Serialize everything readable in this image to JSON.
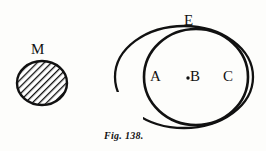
{
  "figure": {
    "caption": "Fig. 138.",
    "background_color": "#fdfdfb",
    "ink_color": "#111111",
    "labels": {
      "m": "M",
      "e": "E",
      "a": "A",
      "b": "B",
      "c": "C"
    },
    "shapes": {
      "hatched_circle": {
        "name": "M",
        "center_x": 42,
        "center_y": 83,
        "radius_x": 25,
        "radius_y": 22,
        "fill": "diagonal-hatch",
        "hatch_angle_deg": 45,
        "stroke_color": "#111111"
      },
      "outer_ellipse": {
        "name": "E",
        "center_x": 184,
        "center_y": 77,
        "radius_x": 69,
        "radius_y": 51,
        "open_gap": true,
        "gap_location": "lower-left",
        "stroke_color": "#111111"
      },
      "inner_ellipse": {
        "name": "ABC",
        "center_x": 196,
        "center_y": 77,
        "radius_x": 52,
        "radius_y": 48,
        "open_gap": false,
        "stroke_color": "#111111"
      },
      "point_b": {
        "name": "B",
        "x": 188,
        "y": 78,
        "radius": 1.6,
        "fill": "#111111"
      }
    }
  }
}
